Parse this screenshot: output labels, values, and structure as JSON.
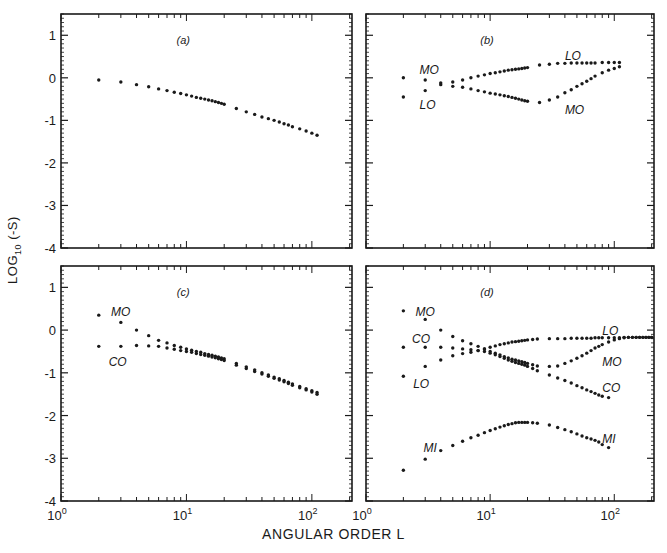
{
  "figure": {
    "ylabel_main": "LOG",
    "ylabel_sub": "10",
    "ylabel_tail": " (-S)",
    "xlabel": "ANGULAR ORDER L"
  },
  "axes": {
    "x_scale": "log10",
    "x_range_log": [
      0,
      2.32
    ],
    "x_tick_labels": [
      {
        "base": "10",
        "exp": "0"
      },
      {
        "base": "10",
        "exp": "1"
      },
      {
        "base": "10",
        "exp": "2"
      }
    ],
    "y_range": [
      -4,
      1.5
    ],
    "y_tick_labels": [
      "1",
      "0",
      "-1",
      "-2",
      "-3",
      "-4"
    ],
    "y_ticks": [
      1,
      0,
      -1,
      -2,
      -3,
      -4
    ]
  },
  "chart_data": [
    {
      "type": "scatter",
      "title": "(a)",
      "xlabel": "ANGULAR ORDER L",
      "ylabel": "LOG10 (-S)",
      "x_scale": "log",
      "xlim": [
        1,
        210
      ],
      "ylim": [
        -4,
        1.5
      ],
      "series": [
        {
          "name": "",
          "x": [
            2,
            3,
            4,
            5,
            6,
            7,
            8,
            9,
            10,
            11,
            12,
            13,
            14,
            15,
            16,
            17,
            18,
            19,
            20,
            25,
            30,
            35,
            40,
            45,
            50,
            55,
            60,
            65,
            70,
            80,
            90,
            100,
            110
          ],
          "y": [
            -0.05,
            -0.1,
            -0.16,
            -0.21,
            -0.26,
            -0.3,
            -0.34,
            -0.37,
            -0.4,
            -0.43,
            -0.46,
            -0.48,
            -0.5,
            -0.52,
            -0.54,
            -0.56,
            -0.58,
            -0.6,
            -0.62,
            -0.72,
            -0.8,
            -0.86,
            -0.92,
            -0.96,
            -1.0,
            -1.04,
            -1.08,
            -1.11,
            -1.15,
            -1.2,
            -1.25,
            -1.3,
            -1.35
          ]
        }
      ],
      "labels": []
    },
    {
      "type": "scatter",
      "title": "(b)",
      "x_scale": "log",
      "xlim": [
        1,
        210
      ],
      "ylim": [
        -4,
        1.5
      ],
      "series": [
        {
          "name": "LO",
          "x": [
            2,
            3,
            4,
            5,
            6,
            7,
            8,
            9,
            10,
            11,
            12,
            13,
            14,
            15,
            16,
            17,
            18,
            19,
            20,
            25,
            30,
            35,
            40,
            45,
            50,
            55,
            60,
            65,
            70,
            80,
            90,
            100,
            110
          ],
          "y": [
            -0.45,
            -0.3,
            -0.12,
            -0.1,
            -0.05,
            0.0,
            0.04,
            0.07,
            0.1,
            0.12,
            0.14,
            0.16,
            0.18,
            0.19,
            0.2,
            0.21,
            0.22,
            0.23,
            0.24,
            0.3,
            0.32,
            0.34,
            0.34,
            0.35,
            0.35,
            0.35,
            0.35,
            0.35,
            0.35,
            0.36,
            0.36,
            0.36,
            0.36
          ]
        },
        {
          "name": "MO",
          "x": [
            2,
            3,
            4,
            5,
            6,
            7,
            8,
            9,
            10,
            11,
            12,
            13,
            14,
            15,
            16,
            17,
            18,
            19,
            20,
            25,
            30,
            35,
            40,
            45,
            50,
            55,
            60,
            65,
            70,
            80,
            90,
            100,
            110
          ],
          "y": [
            0.0,
            -0.05,
            -0.16,
            -0.2,
            -0.22,
            -0.26,
            -0.3,
            -0.33,
            -0.36,
            -0.38,
            -0.4,
            -0.42,
            -0.44,
            -0.46,
            -0.48,
            -0.5,
            -0.52,
            -0.54,
            -0.55,
            -0.58,
            -0.52,
            -0.45,
            -0.35,
            -0.28,
            -0.2,
            -0.14,
            -0.08,
            -0.02,
            0.04,
            0.12,
            0.18,
            0.22,
            0.26
          ]
        }
      ],
      "labels": [
        {
          "text": "MO",
          "x": 2.7,
          "y": 0.18
        },
        {
          "text": "LO",
          "x": 2.7,
          "y": -0.65
        },
        {
          "text": "LO",
          "x": 40,
          "y": 0.52
        },
        {
          "text": "MO",
          "x": 40,
          "y": -0.75
        }
      ]
    },
    {
      "type": "scatter",
      "title": "(c)",
      "x_scale": "log",
      "xlim": [
        1,
        210
      ],
      "ylim": [
        -4,
        1.5
      ],
      "series": [
        {
          "name": "MO",
          "x": [
            2,
            3,
            4,
            5,
            6,
            7,
            8,
            9,
            10,
            11,
            12,
            13,
            14,
            15,
            16,
            17,
            18,
            19,
            20,
            25,
            30,
            35,
            40,
            45,
            50,
            55,
            60,
            65,
            70,
            80,
            90,
            100,
            110
          ],
          "y": [
            0.35,
            0.18,
            0.0,
            -0.13,
            -0.24,
            -0.3,
            -0.36,
            -0.4,
            -0.44,
            -0.47,
            -0.5,
            -0.52,
            -0.55,
            -0.57,
            -0.59,
            -0.61,
            -0.63,
            -0.65,
            -0.67,
            -0.78,
            -0.86,
            -0.93,
            -1.0,
            -1.05,
            -1.1,
            -1.14,
            -1.18,
            -1.22,
            -1.26,
            -1.32,
            -1.37,
            -1.42,
            -1.46
          ]
        },
        {
          "name": "CO",
          "x": [
            2,
            3,
            4,
            5,
            6,
            7,
            8,
            9,
            10,
            11,
            12,
            13,
            14,
            15,
            16,
            17,
            18,
            19,
            20,
            25,
            30,
            35,
            40,
            45,
            50,
            55,
            60,
            65,
            70,
            80,
            90,
            100,
            110
          ],
          "y": [
            -0.38,
            -0.38,
            -0.36,
            -0.37,
            -0.38,
            -0.42,
            -0.45,
            -0.48,
            -0.5,
            -0.52,
            -0.55,
            -0.57,
            -0.59,
            -0.61,
            -0.63,
            -0.65,
            -0.67,
            -0.69,
            -0.71,
            -0.82,
            -0.9,
            -0.97,
            -1.03,
            -1.08,
            -1.13,
            -1.17,
            -1.21,
            -1.25,
            -1.29,
            -1.35,
            -1.4,
            -1.45,
            -1.5
          ]
        }
      ],
      "labels": [
        {
          "text": "MO",
          "x": 2.5,
          "y": 0.42
        },
        {
          "text": "CO",
          "x": 2.4,
          "y": -0.75
        }
      ]
    },
    {
      "type": "scatter",
      "title": "(d)",
      "x_scale": "log",
      "xlim": [
        1,
        210
      ],
      "ylim": [
        -4,
        1.5
      ],
      "series": [
        {
          "name": "MO",
          "x": [
            2,
            3,
            4,
            5,
            6,
            7,
            8,
            9,
            10,
            11,
            12,
            13,
            14,
            15,
            16,
            17,
            18,
            19,
            20,
            22,
            24,
            30,
            35,
            40,
            45,
            50,
            55,
            60,
            65,
            70,
            75,
            80,
            90,
            100,
            110,
            120,
            130,
            140,
            150,
            160,
            170,
            180,
            190,
            200
          ],
          "y": [
            0.45,
            0.25,
            0.0,
            -0.15,
            -0.25,
            -0.32,
            -0.38,
            -0.44,
            -0.5,
            -0.54,
            -0.58,
            -0.62,
            -0.65,
            -0.68,
            -0.7,
            -0.72,
            -0.74,
            -0.76,
            -0.78,
            -0.81,
            -0.84,
            -0.85,
            -0.84,
            -0.78,
            -0.72,
            -0.66,
            -0.6,
            -0.54,
            -0.48,
            -0.42,
            -0.38,
            -0.34,
            -0.28,
            -0.23,
            -0.2,
            -0.18,
            -0.17,
            -0.17,
            -0.17,
            -0.17,
            -0.17,
            -0.17,
            -0.17,
            -0.17
          ]
        },
        {
          "name": "CO",
          "x": [
            2,
            3,
            4,
            5,
            6,
            7,
            8,
            9,
            10,
            11,
            12,
            13,
            14,
            15,
            16,
            17,
            18,
            19,
            20,
            22,
            24,
            30,
            35,
            40,
            45,
            50,
            55,
            60,
            65,
            70,
            75,
            80,
            90
          ],
          "y": [
            -0.4,
            -0.4,
            -0.4,
            -0.42,
            -0.44,
            -0.46,
            -0.48,
            -0.5,
            -0.54,
            -0.58,
            -0.62,
            -0.66,
            -0.7,
            -0.73,
            -0.76,
            -0.78,
            -0.8,
            -0.82,
            -0.85,
            -0.9,
            -0.95,
            -1.05,
            -1.12,
            -1.18,
            -1.24,
            -1.3,
            -1.35,
            -1.4,
            -1.44,
            -1.48,
            -1.52,
            -1.55,
            -1.58
          ]
        },
        {
          "name": "LO",
          "x": [
            2,
            3,
            4,
            5,
            6,
            7,
            8,
            9,
            10,
            11,
            12,
            13,
            14,
            15,
            16,
            17,
            18,
            19,
            20,
            22,
            24,
            30,
            35,
            40,
            45,
            50,
            55,
            60,
            65,
            70,
            75,
            80,
            90,
            100,
            110,
            120,
            130,
            140,
            150,
            160,
            170,
            180,
            190,
            200
          ],
          "y": [
            -1.08,
            -0.85,
            -0.7,
            -0.6,
            -0.55,
            -0.52,
            -0.48,
            -0.44,
            -0.4,
            -0.37,
            -0.34,
            -0.32,
            -0.3,
            -0.28,
            -0.27,
            -0.26,
            -0.25,
            -0.24,
            -0.23,
            -0.22,
            -0.21,
            -0.2,
            -0.2,
            -0.2,
            -0.19,
            -0.19,
            -0.19,
            -0.19,
            -0.19,
            -0.18,
            -0.18,
            -0.18,
            -0.18,
            -0.18,
            -0.18,
            -0.17,
            -0.17,
            -0.17,
            -0.17,
            -0.17,
            -0.17,
            -0.17,
            -0.17,
            -0.17
          ]
        },
        {
          "name": "MI",
          "x": [
            2,
            3,
            4,
            5,
            6,
            7,
            8,
            9,
            10,
            11,
            12,
            13,
            14,
            15,
            16,
            17,
            18,
            19,
            20,
            22,
            24,
            30,
            35,
            40,
            45,
            50,
            55,
            60,
            65,
            70,
            75,
            80,
            90
          ],
          "y": [
            -3.28,
            -3.02,
            -2.82,
            -2.7,
            -2.6,
            -2.52,
            -2.46,
            -2.4,
            -2.35,
            -2.31,
            -2.27,
            -2.24,
            -2.21,
            -2.19,
            -2.17,
            -2.16,
            -2.16,
            -2.16,
            -2.16,
            -2.17,
            -2.18,
            -2.22,
            -2.28,
            -2.33,
            -2.38,
            -2.43,
            -2.48,
            -2.52,
            -2.55,
            -2.58,
            -2.62,
            -2.68,
            -2.75
          ]
        }
      ],
      "labels": [
        {
          "text": "MO",
          "x": 2.5,
          "y": 0.42
        },
        {
          "text": "CO",
          "x": 2.35,
          "y": -0.22
        },
        {
          "text": "LO",
          "x": 2.4,
          "y": -1.25
        },
        {
          "text": "LO",
          "x": 80,
          "y": -0.02
        },
        {
          "text": "MO",
          "x": 80,
          "y": -0.75
        },
        {
          "text": "CO",
          "x": 80,
          "y": -1.35
        },
        {
          "text": "MI",
          "x": 2.9,
          "y": -2.75
        },
        {
          "text": "MI",
          "x": 80,
          "y": -2.55
        }
      ]
    }
  ],
  "layout": {
    "panels": [
      {
        "left": 61,
        "top": 14,
        "width": 291,
        "height": 234
      },
      {
        "left": 366,
        "top": 14,
        "width": 288,
        "height": 234
      },
      {
        "left": 61,
        "top": 266,
        "width": 291,
        "height": 235
      },
      {
        "left": 366,
        "top": 266,
        "width": 288,
        "height": 235
      }
    ],
    "ink_color": "#1a1a1a"
  }
}
